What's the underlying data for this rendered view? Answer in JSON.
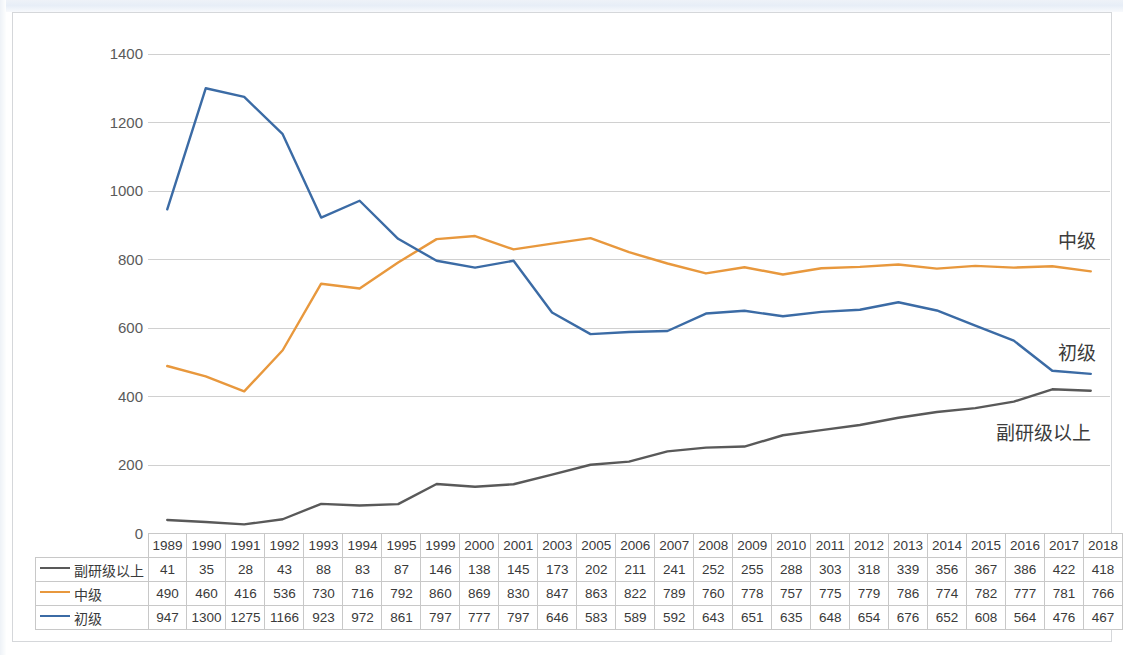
{
  "chart_data": {
    "type": "line",
    "title": "",
    "xlabel": "",
    "ylabel": "",
    "ylim": [
      0,
      1400
    ],
    "ytick_step": 200,
    "yticks": [
      0,
      200,
      400,
      600,
      800,
      1000,
      1200,
      1400
    ],
    "grid": true,
    "legend_position": "bottom-table",
    "categories": [
      "1989",
      "1990",
      "1991",
      "1992",
      "1993",
      "1994",
      "1995",
      "1999",
      "2000",
      "2001",
      "2003",
      "2005",
      "2006",
      "2007",
      "2008",
      "2009",
      "2010",
      "2011",
      "2012",
      "2013",
      "2014",
      "2015",
      "2016",
      "2017",
      "2018"
    ],
    "series": [
      {
        "name": "副研级以上",
        "color": "#595959",
        "values": [
          41,
          35,
          28,
          43,
          88,
          83,
          87,
          146,
          138,
          145,
          173,
          202,
          211,
          241,
          252,
          255,
          288,
          303,
          318,
          339,
          356,
          367,
          386,
          422,
          418
        ]
      },
      {
        "name": "中级",
        "color": "#E8983D",
        "values": [
          490,
          460,
          416,
          536,
          730,
          716,
          792,
          860,
          869,
          830,
          847,
          863,
          822,
          789,
          760,
          778,
          757,
          775,
          779,
          786,
          774,
          782,
          777,
          781,
          766
        ]
      },
      {
        "name": "初级",
        "color": "#3B6BA5",
        "values": [
          947,
          1300,
          1275,
          1166,
          923,
          972,
          861,
          797,
          777,
          797,
          646,
          583,
          589,
          592,
          643,
          651,
          635,
          648,
          654,
          676,
          652,
          608,
          564,
          476,
          467
        ]
      }
    ],
    "annotations": [
      {
        "text": "中级",
        "series": "中级"
      },
      {
        "text": "初级",
        "series": "初级"
      },
      {
        "text": "副研级以上",
        "series": "副研级以上"
      }
    ]
  },
  "colors": {
    "senior": "#595959",
    "mid": "#E8983D",
    "junior": "#3B6BA5",
    "gridline": "#d0d0d0",
    "axis_text": "#5a5a5a",
    "frame": "#d5d7da"
  },
  "table": {
    "header_blank": "",
    "years": [
      "1989",
      "1990",
      "1991",
      "1992",
      "1993",
      "1994",
      "1995",
      "1999",
      "2000",
      "2001",
      "2003",
      "2005",
      "2006",
      "2007",
      "2008",
      "2009",
      "2010",
      "2011",
      "2012",
      "2013",
      "2014",
      "2015",
      "2016",
      "2017",
      "2018"
    ],
    "rows": [
      {
        "label": "副研级以上",
        "color": "#595959",
        "values": [
          "41",
          "35",
          "28",
          "43",
          "88",
          "83",
          "87",
          "146",
          "138",
          "145",
          "173",
          "202",
          "211",
          "241",
          "252",
          "255",
          "288",
          "303",
          "318",
          "339",
          "356",
          "367",
          "386",
          "422",
          "418"
        ]
      },
      {
        "label": "中级",
        "color": "#E8983D",
        "values": [
          "490",
          "460",
          "416",
          "536",
          "730",
          "716",
          "792",
          "860",
          "869",
          "830",
          "847",
          "863",
          "822",
          "789",
          "760",
          "778",
          "757",
          "775",
          "779",
          "786",
          "774",
          "782",
          "777",
          "781",
          "766"
        ]
      },
      {
        "label": "初级",
        "color": "#3B6BA5",
        "values": [
          "947",
          "1300",
          "1275",
          "1166",
          "923",
          "972",
          "861",
          "797",
          "777",
          "797",
          "646",
          "583",
          "589",
          "592",
          "643",
          "651",
          "635",
          "648",
          "654",
          "676",
          "652",
          "608",
          "564",
          "476",
          "467"
        ]
      }
    ]
  },
  "annotations": {
    "mid_label": "中级",
    "junior_label": "初级",
    "senior_label": "副研级以上"
  }
}
